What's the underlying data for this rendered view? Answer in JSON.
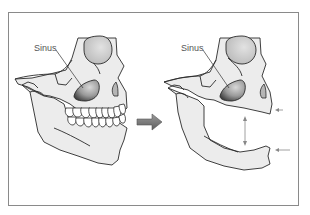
{
  "figure": {
    "type": "anatomical illustration",
    "panels": [
      {
        "id": "before",
        "description": "Skull side view with full upper and lower teeth",
        "label": "Sinus"
      },
      {
        "id": "after",
        "description": "Skull side view without teeth (edentulous), showing reduced jaw height",
        "label": "Sinus"
      }
    ],
    "transition_arrow": "right-arrow",
    "annotations": {
      "vertical_gap_arrow": "double-headed vertical arrow",
      "side_arrows": [
        "left-arrow",
        "left-arrow"
      ]
    }
  },
  "colors": {
    "frame": "#8a8a8a",
    "bone_fill": "#ececec",
    "outline": "#2a2a2a",
    "sinus_dark": "#4a4a4a",
    "sinus_light": "#c9c9c9",
    "arrow_fill": "#7a7a7a",
    "label_text": "#555555",
    "thin_arrow": "#888888"
  }
}
